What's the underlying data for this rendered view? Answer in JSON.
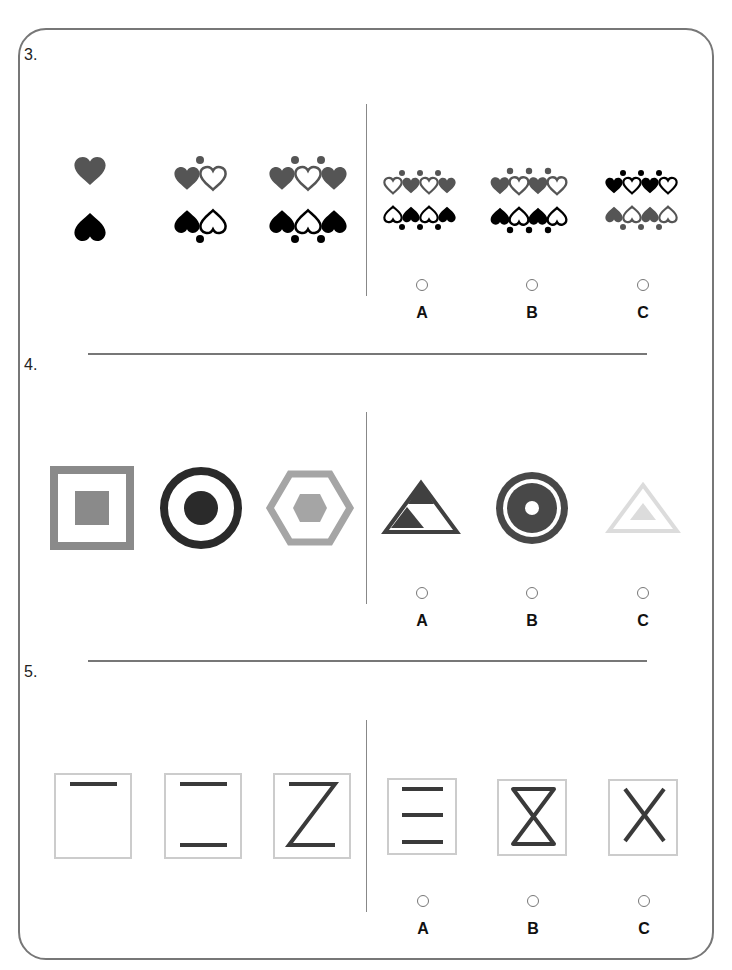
{
  "questions": [
    {
      "number": "3.",
      "description": "Pattern of heart rows: grey hearts above with dots, black hearts below with dots",
      "stimulus": [
        {
          "top": "1 grey heart",
          "bottom": "1 black heart"
        },
        {
          "top": "grey heart + outline heart, 1 dot above",
          "bottom": "black heart + outline heart, 1 dot below"
        },
        {
          "top": "grey, outline, grey hearts, 2 dots above",
          "bottom": "black, outline, black hearts, 2 dots below"
        }
      ],
      "options": [
        {
          "label": "A",
          "top": "outline, grey, outline, grey; 3 dots above",
          "bottom": "outline, black, outline, black; 3 dots below"
        },
        {
          "label": "B",
          "top": "grey, outline, grey, outline; 3 dots above",
          "bottom": "black, outline, black, outline; 3 dots below"
        },
        {
          "label": "C",
          "top": "black, outline, black, outline; 3 dots above",
          "bottom": "grey, outline, grey, outline; 3 dots below"
        }
      ]
    },
    {
      "number": "4.",
      "description": "Shape inside same shape",
      "stimulus": [
        {
          "shape": "square in square",
          "color": "#8a8a8a"
        },
        {
          "shape": "circle in ring",
          "color": "#2a2a2a"
        },
        {
          "shape": "hexagon in hexagon",
          "color": "#a5a5a5"
        }
      ],
      "options": [
        {
          "label": "A",
          "shape": "triangle with mixed triangles",
          "color": "#404040"
        },
        {
          "label": "B",
          "shape": "ring with disc and hole",
          "color": "#484848"
        },
        {
          "label": "C",
          "shape": "triangle in triangle",
          "color": "#dcdcdc"
        }
      ]
    },
    {
      "number": "5.",
      "description": "Strokes added in boxes",
      "stimulus": [
        {
          "shape": "top line"
        },
        {
          "shape": "top and bottom lines"
        },
        {
          "shape": "Z"
        }
      ],
      "options": [
        {
          "label": "A",
          "shape": "three horizontal lines"
        },
        {
          "label": "B",
          "shape": "hourglass"
        },
        {
          "label": "C",
          "shape": "X"
        }
      ]
    }
  ],
  "colors": {
    "frame": "#777777",
    "grey_heart": "#555555",
    "black_heart": "#000000",
    "box_border": "#cccccc",
    "stroke": "#3a3a3a"
  }
}
